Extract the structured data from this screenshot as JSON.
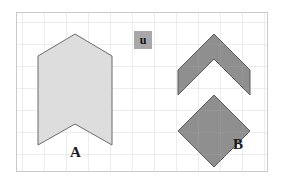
{
  "figure": {
    "canvas": {
      "width": 285,
      "height": 185,
      "background": "#ffffff"
    },
    "frame": {
      "x": 16,
      "y": 12,
      "width": 252,
      "height": 160,
      "border_color": "#c9c9c9",
      "fill": "#ffffff"
    },
    "grid": {
      "cell_size": 22,
      "line_color": "#dedede",
      "visible": true
    },
    "shapes": [
      {
        "id": "shape-a",
        "label": "A",
        "fill": "#dddddd",
        "stroke": "#6b6b6b",
        "stroke_width": 1,
        "description": "banner pentagon with notched bottom",
        "points": "38,56 75,34 112,56 112,145 75,124 38,145"
      },
      {
        "id": "shape-b",
        "label": "B",
        "fill": "#8f8f8f",
        "stroke": "#5a5a5a",
        "stroke_width": 1,
        "description": "two stacked diamonds forming left and right notches",
        "points": "214,34 250,70 250,95 214,59 178,95 178,70"
      },
      {
        "id": "shape-b-lower",
        "label": "B",
        "fill": "#8f8f8f",
        "stroke": "#5a5a5a",
        "stroke_width": 1,
        "description": "lower diamond of shape B",
        "points": "214,95 250,131 214,167 178,131"
      }
    ],
    "labels": {
      "a": "A",
      "b": "B",
      "u": "u"
    },
    "u_marker": {
      "text": "u",
      "x": 134,
      "y": 31,
      "size": 18,
      "background": "#a8a8a8",
      "color": "#111111"
    }
  }
}
